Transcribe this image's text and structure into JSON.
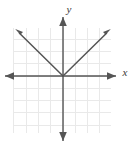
{
  "figure": {
    "title": "",
    "background_color": "#ffffff",
    "width": 134,
    "height": 147
  },
  "axes": {
    "x_label": "x",
    "y_label": "y",
    "axis_color": "#555555",
    "grid_color": "#e9e9e9",
    "origin_px": {
      "x": 63,
      "y": 76
    },
    "cell_px": 12.3,
    "x_axis_px": {
      "x1": 5,
      "x2": 116,
      "y": 76
    },
    "y_axis_px": {
      "y1": 17,
      "y2": 141,
      "x": 63
    },
    "arrows": [
      "left",
      "right",
      "up",
      "down"
    ],
    "grid": {
      "visible": true,
      "left_px": 13.5,
      "right_px": 110.5,
      "top_px": 27.5,
      "bottom_px": 132.5,
      "columns": 8,
      "rows": 8.5
    }
  },
  "chart_data": {
    "type": "line",
    "title": "",
    "xlabel": "x",
    "ylabel": "y",
    "grid": true,
    "legend": null,
    "xlim": [
      -4,
      4
    ],
    "ylim": [
      -4,
      4.5
    ],
    "series": [
      {
        "name": "absolute-value-graph",
        "description": "V-shaped graph, vertex at origin, two rays with arrowheads rising to upper-left and upper-right",
        "color": "#555555",
        "x": [
          -3.8,
          0,
          3.8
        ],
        "y": [
          3.75,
          0,
          3.75
        ],
        "vertex": {
          "x": 0,
          "y": 0
        },
        "slope_left": -1,
        "slope_right": 1,
        "endpoints_px": [
          {
            "x": 15.5,
            "y": 29.5
          },
          {
            "x": 63,
            "y": 76
          },
          {
            "x": 110.5,
            "y": 29.5
          }
        ]
      }
    ]
  },
  "icons": {
    "arrow_head": "arrow-head-icon"
  }
}
